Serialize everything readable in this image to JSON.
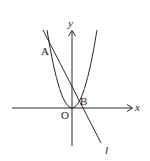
{
  "diagram": {
    "type": "coordinate-plot",
    "labels": {
      "x_axis": "x",
      "y_axis": "y",
      "origin": "O",
      "point_a": "A",
      "point_b": "B",
      "line": "l"
    },
    "colors": {
      "stroke": "#2a2a2a",
      "background": "#ffffff"
    }
  }
}
